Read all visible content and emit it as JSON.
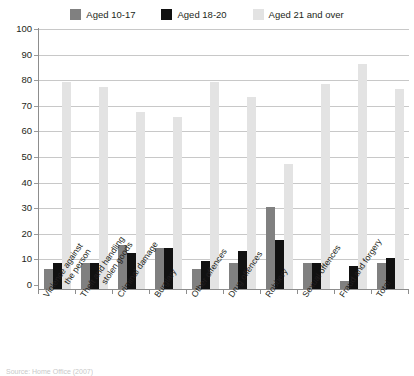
{
  "legend": {
    "position": "top-center",
    "entries": [
      {
        "label": "Aged 10-17",
        "color": "#808080",
        "name": "aged-10-17"
      },
      {
        "label": "Aged 18-20",
        "color": "#111111",
        "name": "aged-18-20"
      },
      {
        "label": "Aged 21 and over",
        "color": "#e3e3e3",
        "name": "aged-21-and-over"
      }
    ]
  },
  "axis": {
    "y_ticks": [
      "0",
      "10",
      "20",
      "30",
      "40",
      "50",
      "60",
      "70",
      "80",
      "90",
      "100"
    ]
  },
  "caption": "Source: Home Office (2007)",
  "chart_data": {
    "type": "bar",
    "title": "",
    "xlabel": "",
    "ylabel": "",
    "ylim": [
      0,
      100
    ],
    "ytick_step": 10,
    "grid": true,
    "legend_position": "top-center",
    "categories": [
      "Violence against the person",
      "Theft and handling stolen goods",
      "Criminal damage",
      "Burglary",
      "Other offences",
      "Drug offences",
      "Robbery",
      "Sexual offences",
      "Fraud and forgery",
      "Total"
    ],
    "category_lines": [
      [
        "Violence against",
        "the person"
      ],
      [
        "Theft and handling",
        "stolen goods"
      ],
      [
        "Criminal damage"
      ],
      [
        "Burglary"
      ],
      [
        "Other offences"
      ],
      [
        "Drug offences"
      ],
      [
        "Robbery"
      ],
      [
        "Sexual offences"
      ],
      [
        "Fraud and forgery"
      ],
      [
        "Total"
      ]
    ],
    "series": [
      {
        "name": "Aged 10-17",
        "color": "#808080",
        "values": [
          8,
          10,
          17,
          16,
          8,
          10,
          32,
          10,
          3,
          10
        ]
      },
      {
        "name": "Aged 18-20",
        "color": "#111111",
        "values": [
          10,
          10,
          14,
          16,
          11,
          15,
          19,
          10,
          9,
          12
        ]
      },
      {
        "name": "Aged 21 and over",
        "color": "#e3e3e3",
        "values": [
          81,
          79,
          69,
          67,
          81,
          75,
          49,
          80,
          88,
          78
        ]
      }
    ]
  }
}
